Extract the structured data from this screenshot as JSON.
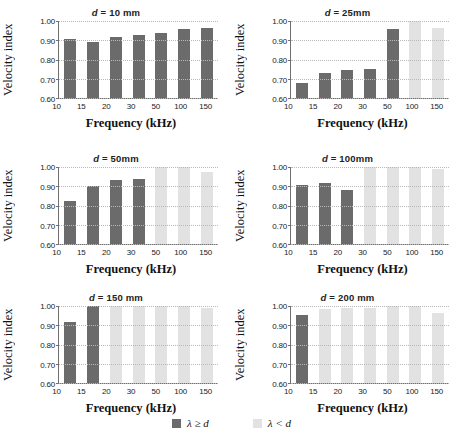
{
  "figure": {
    "legend": [
      {
        "label": "λ ≥ d",
        "swatch": "dark",
        "color": "#6b6b6b",
        "name": "lambda-ge-d"
      },
      {
        "label": "λ < d",
        "swatch": "light",
        "color": "#e2e2e2",
        "name": "lambda-lt-d"
      }
    ]
  },
  "chart_data": [
    {
      "type": "bar",
      "title": "d = 10 mm",
      "title_var": "d",
      "title_rest": " = 10 mm",
      "xlabel": "Frequency (kHz)",
      "ylabel": "Velocity index",
      "categories": [
        "10",
        "15",
        "20",
        "30",
        "50",
        "100",
        "150"
      ],
      "values": [
        0.905,
        0.893,
        0.917,
        0.925,
        0.938,
        0.958,
        0.963
      ],
      "classes": [
        "dark",
        "dark",
        "dark",
        "dark",
        "dark",
        "dark",
        "dark"
      ],
      "ylim": [
        0.6,
        1.0
      ],
      "yticks": [
        "1.00",
        "0.90",
        "0.80",
        "0.70",
        "0.60"
      ],
      "grid": true,
      "legend_position": "bottom"
    },
    {
      "type": "bar",
      "title": "d = 25mm",
      "title_var": "d",
      "title_rest": " = 25mm",
      "xlabel": "Frequency (kHz)",
      "ylabel": "Velocity index",
      "categories": [
        "10",
        "15",
        "20",
        "30",
        "50",
        "100",
        "150"
      ],
      "values": [
        0.678,
        0.73,
        0.745,
        0.75,
        0.96,
        1.0,
        0.962
      ],
      "classes": [
        "dark",
        "dark",
        "dark",
        "dark",
        "dark",
        "light",
        "light"
      ],
      "ylim": [
        0.6,
        1.0
      ],
      "yticks": [
        "1.00",
        "0.90",
        "0.80",
        "0.70",
        "0.60"
      ],
      "grid": true,
      "legend_position": "bottom"
    },
    {
      "type": "bar",
      "title": "d = 50mm",
      "title_var": "d",
      "title_rest": " = 50mm",
      "xlabel": "Frequency (kHz)",
      "ylabel": "Velocity index",
      "categories": [
        "10",
        "15",
        "20",
        "30",
        "50",
        "100",
        "150"
      ],
      "values": [
        0.823,
        0.902,
        0.932,
        0.936,
        0.998,
        0.998,
        0.975
      ],
      "classes": [
        "dark",
        "dark",
        "dark",
        "dark",
        "light",
        "light",
        "light"
      ],
      "ylim": [
        0.6,
        1.0
      ],
      "yticks": [
        "1.00",
        "0.90",
        "0.80",
        "0.70",
        "0.60"
      ],
      "grid": true,
      "legend_position": "bottom"
    },
    {
      "type": "bar",
      "title": "d = 100mm",
      "title_var": "d",
      "title_rest": " = 100mm",
      "xlabel": "Frequency (kHz)",
      "ylabel": "Velocity index",
      "categories": [
        "10",
        "15",
        "20",
        "30",
        "50",
        "100",
        "150"
      ],
      "values": [
        0.906,
        0.917,
        0.882,
        1.0,
        1.0,
        0.998,
        0.99
      ],
      "classes": [
        "dark",
        "dark",
        "dark",
        "light",
        "light",
        "light",
        "light"
      ],
      "ylim": [
        0.6,
        1.0
      ],
      "yticks": [
        "1.00",
        "0.90",
        "0.80",
        "0.70",
        "0.60"
      ],
      "grid": true,
      "legend_position": "bottom"
    },
    {
      "type": "bar",
      "title": "d = 150 mm",
      "title_var": "d",
      "title_rest": " = 150 mm",
      "xlabel": "Frequency (kHz)",
      "ylabel": "Velocity index",
      "categories": [
        "10",
        "15",
        "20",
        "30",
        "50",
        "100",
        "150"
      ],
      "values": [
        0.918,
        1.0,
        0.998,
        0.998,
        0.998,
        0.998,
        0.99
      ],
      "classes": [
        "dark",
        "dark",
        "light",
        "light",
        "light",
        "light",
        "light"
      ],
      "ylim": [
        0.6,
        1.0
      ],
      "yticks": [
        "1.00",
        "0.90",
        "0.80",
        "0.70",
        "0.60"
      ],
      "grid": true,
      "legend_position": "bottom"
    },
    {
      "type": "bar",
      "title": "d = 200 mm",
      "title_var": "d",
      "title_rest": " = 200 mm",
      "xlabel": "Frequency (kHz)",
      "ylabel": "Velocity index",
      "categories": [
        "10",
        "15",
        "20",
        "30",
        "50",
        "100",
        "150"
      ],
      "values": [
        0.952,
        0.982,
        0.99,
        0.992,
        1.0,
        0.998,
        0.965
      ],
      "classes": [
        "dark",
        "light",
        "light",
        "light",
        "light",
        "light",
        "light"
      ],
      "ylim": [
        0.6,
        1.0
      ],
      "yticks": [
        "1.00",
        "0.90",
        "0.80",
        "0.70",
        "0.60"
      ],
      "grid": true,
      "legend_position": "bottom"
    }
  ]
}
